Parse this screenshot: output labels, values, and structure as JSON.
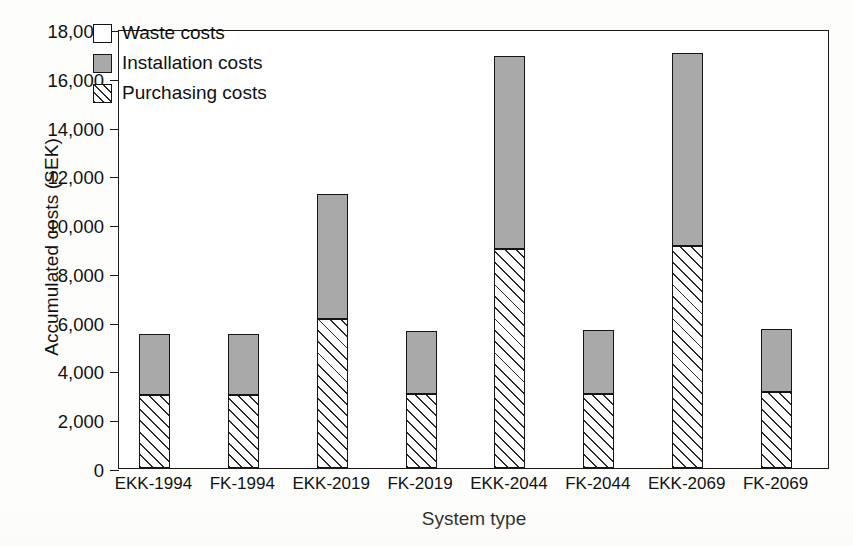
{
  "chart_data": {
    "type": "bar",
    "stacked": true,
    "title": "",
    "xlabel": "System type",
    "ylabel": "Accumulated costs (SEK)",
    "categories": [
      "EKK-1994",
      "FK-1994",
      "EKK-2019",
      "FK-2019",
      "EKK-2044",
      "FK-2044",
      "EKK-2069",
      "FK-2069"
    ],
    "series": [
      {
        "name": "Purchasing costs",
        "values": [
          3000,
          3000,
          6100,
          3050,
          9000,
          3050,
          9100,
          3100
        ]
      },
      {
        "name": "Installation costs",
        "values": [
          2500,
          2500,
          5150,
          2550,
          7900,
          2600,
          7900,
          2600
        ]
      },
      {
        "name": "Waste costs",
        "values": [
          0,
          0,
          0,
          0,
          0,
          0,
          0,
          0
        ]
      }
    ],
    "totals": [
      5500,
      5500,
      11250,
      5600,
      16900,
      5650,
      17000,
      5700
    ],
    "ylim": [
      0,
      18000
    ],
    "ytick_values": [
      0,
      2000,
      4000,
      6000,
      8000,
      10000,
      12000,
      14000,
      16000,
      18000
    ],
    "ytick_labels": [
      "0",
      "2,000",
      "4,000",
      "6,000",
      "8,000",
      "10,000",
      "12,000",
      "14,000",
      "16,000",
      "18,000"
    ],
    "grid": false,
    "legend_position": "top-left",
    "legend": [
      {
        "label": "Waste costs",
        "pattern": "empty",
        "color": "#ffffff"
      },
      {
        "label": "Installation costs",
        "pattern": "solid",
        "color": "#a9a9a9"
      },
      {
        "label": "Purchasing costs",
        "pattern": "diagonal-hatch",
        "color": "#ffffff"
      }
    ]
  },
  "axes": {
    "y_title": "Accumulated costs (SEK)",
    "x_title": "System type"
  },
  "colors": {
    "installation_fill": "#a9a9a9",
    "waste_fill": "#ffffff",
    "hatch_stroke": "#2a2a2a",
    "outline": "#151515",
    "background": "#ffffff"
  }
}
